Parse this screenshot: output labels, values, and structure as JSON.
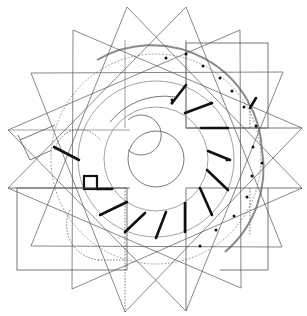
{
  "diagram": {
    "width": 307,
    "height": 316,
    "background": "#ffffff",
    "colors": {
      "thin": "#555555",
      "faint": "#8a8a8a",
      "thick": "#111111",
      "dot": "#111111"
    },
    "center": [
      156,
      159
    ],
    "star_tips": [
      [
        127,
        7
      ],
      [
        186,
        7
      ],
      [
        240,
        30
      ],
      [
        283,
        72
      ],
      [
        302,
        128
      ],
      [
        302,
        188
      ],
      [
        282,
        247
      ],
      [
        241,
        288
      ],
      [
        186,
        311
      ],
      [
        125,
        312
      ],
      [
        72,
        289
      ],
      [
        31,
        246
      ],
      [
        8,
        188
      ],
      [
        8,
        130
      ],
      [
        31,
        73
      ],
      [
        73,
        30
      ]
    ],
    "star_valleys_radius": 72,
    "circles": [
      {
        "r": 28,
        "style": "thin"
      },
      {
        "r": 52,
        "style": "faint",
        "dashed": false
      },
      {
        "r": 78,
        "style": "faint",
        "dashed": false
      },
      {
        "r": 105,
        "style": "faint",
        "dashed": true
      }
    ],
    "arcs": [
      {
        "d": "M 97 60 A 110 110 0 0 1 262 150",
        "style": "thick-faint"
      },
      {
        "d": "M 262 150 A 110 110 0 0 1 225 252",
        "style": "thick-faint"
      },
      {
        "d": "M 110 122 A 70 70 0 0 1 175 97",
        "style": "thin"
      },
      {
        "d": "M 55 150 A 25 25 0 0 1 100 140",
        "style": "dashed"
      },
      {
        "d": "M 70 210 A 35 35 0 0 0 100 260",
        "style": "dashed"
      },
      {
        "d": "M 128 120 A 20 20 0 1 1 128 150",
        "style": "thin"
      }
    ],
    "rects": [
      {
        "x": 186,
        "y": 43,
        "w": 82,
        "h": 85,
        "style": "thin"
      },
      {
        "x": 17,
        "y": 188,
        "w": 110,
        "h": 82,
        "style": "thin"
      },
      {
        "x": 84,
        "y": 176,
        "w": 13,
        "h": 13,
        "style": "thick"
      }
    ],
    "lines": [
      {
        "x1": 8,
        "y1": 130,
        "x2": 130,
        "y2": 130,
        "style": "faint"
      },
      {
        "x1": 8,
        "y1": 188,
        "x2": 130,
        "y2": 188,
        "style": "thin"
      },
      {
        "x1": 186,
        "y1": 128,
        "x2": 302,
        "y2": 128,
        "style": "thin"
      },
      {
        "x1": 186,
        "y1": 188,
        "x2": 302,
        "y2": 188,
        "style": "thin"
      },
      {
        "x1": 125,
        "y1": 40,
        "x2": 125,
        "y2": 128,
        "style": "faint"
      },
      {
        "x1": 186,
        "y1": 40,
        "x2": 186,
        "y2": 128,
        "style": "faint"
      },
      {
        "x1": 125,
        "y1": 188,
        "x2": 125,
        "y2": 312,
        "style": "dashed"
      },
      {
        "x1": 186,
        "y1": 188,
        "x2": 186,
        "y2": 311,
        "style": "thin"
      },
      {
        "x1": 20,
        "y1": 140,
        "x2": 55,
        "y2": 125,
        "style": "thin"
      },
      {
        "x1": 18,
        "y1": 135,
        "x2": 30,
        "y2": 160,
        "style": "thin"
      },
      {
        "x1": 30,
        "y1": 160,
        "x2": 52,
        "y2": 150,
        "style": "thin"
      },
      {
        "x1": 98,
        "y1": 260,
        "x2": 125,
        "y2": 260,
        "style": "dashed"
      },
      {
        "x1": 250,
        "y1": 105,
        "x2": 250,
        "y2": 128,
        "style": "dashed"
      },
      {
        "x1": 250,
        "y1": 188,
        "x2": 250,
        "y2": 235,
        "style": "dashed"
      },
      {
        "x1": 268,
        "y1": 188,
        "x2": 268,
        "y2": 270,
        "style": "thin"
      },
      {
        "x1": 220,
        "y1": 270,
        "x2": 268,
        "y2": 270,
        "style": "thin"
      }
    ],
    "thick_segments": [
      [
        186,
        85,
        172,
        103
      ],
      [
        185,
        113,
        212,
        103
      ],
      [
        201,
        128,
        228,
        128
      ],
      [
        208,
        151,
        230,
        160
      ],
      [
        207,
        170,
        228,
        190
      ],
      [
        200,
        188,
        212,
        215
      ],
      [
        185,
        203,
        185,
        232
      ],
      [
        166,
        212,
        156,
        238
      ],
      [
        100,
        215,
        127,
        202
      ],
      [
        125,
        232,
        145,
        213
      ],
      [
        54,
        147,
        79,
        160
      ],
      [
        97,
        189,
        112,
        189
      ],
      [
        250,
        108,
        256,
        98
      ]
    ],
    "dots": [
      [
        186,
        54
      ],
      [
        166,
        58
      ],
      [
        203,
        66
      ],
      [
        220,
        78
      ],
      [
        232,
        91
      ],
      [
        244,
        107
      ],
      [
        256,
        126
      ],
      [
        253,
        147
      ],
      [
        262,
        163
      ],
      [
        252,
        176
      ],
      [
        247,
        197
      ],
      [
        234,
        216
      ],
      [
        216,
        230
      ],
      [
        200,
        246
      ],
      [
        172,
        100
      ],
      [
        211,
        103
      ],
      [
        227,
        160
      ],
      [
        172,
        103
      ]
    ]
  }
}
